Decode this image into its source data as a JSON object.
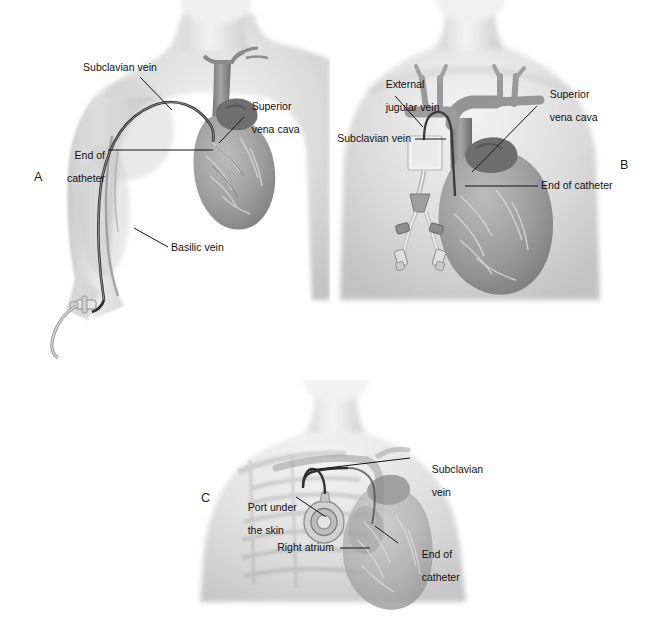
{
  "figure": {
    "width": 660,
    "height": 624,
    "background_color": "#ffffff",
    "ink_color": "#151515",
    "skin_tone": "#d9d9d9",
    "vessel_tone": "#8c8c8c",
    "heart_tone": "#a0a0a0"
  },
  "panels": [
    {
      "letter": "A",
      "name": "peripherally-inserted-central-catheter",
      "labels": [
        {
          "id": "subclavian-vein",
          "text": "Subclavian vein",
          "align": "left"
        },
        {
          "id": "superior-vena-cava",
          "text": "Superior\nvena cava",
          "align": "left"
        },
        {
          "id": "end-of-catheter",
          "text": "End of\ncatheter",
          "align": "right"
        },
        {
          "id": "basilic-vein",
          "text": "Basilic vein",
          "align": "left"
        }
      ]
    },
    {
      "letter": "B",
      "name": "tunneled-central-venous-catheter",
      "labels": [
        {
          "id": "external-jugular-vein",
          "text": "External\njugular vein",
          "align": "left"
        },
        {
          "id": "superior-vena-cava",
          "text": "Superior\nvena cava",
          "align": "left"
        },
        {
          "id": "subclavian-vein",
          "text": "Subclavian vein",
          "align": "left"
        },
        {
          "id": "end-of-catheter",
          "text": "End of catheter",
          "align": "left"
        }
      ]
    },
    {
      "letter": "C",
      "name": "implanted-port",
      "labels": [
        {
          "id": "subclavian-vein",
          "text": "Subclavian\nvein",
          "align": "left"
        },
        {
          "id": "port-under-the-skin",
          "text": "Port under\nthe skin",
          "align": "left"
        },
        {
          "id": "right-atrium",
          "text": "Right atrium",
          "align": "left"
        },
        {
          "id": "end-of-catheter",
          "text": "End of\ncatheter",
          "align": "left"
        }
      ]
    }
  ],
  "panel_a": {
    "letter": "A",
    "label_subclavian_vein": "Subclavian vein",
    "label_superior_vena_cava_line1": "Superior",
    "label_superior_vena_cava_line2": "vena cava",
    "label_end_of_catheter_line1": "End of",
    "label_end_of_catheter_line2": "catheter",
    "label_basilic_vein": "Basilic vein"
  },
  "panel_b": {
    "letter": "B",
    "label_external_jugular_vein_line1": "External",
    "label_external_jugular_vein_line2": "jugular vein",
    "label_superior_vena_cava_line1": "Superior",
    "label_superior_vena_cava_line2": "vena cava",
    "label_subclavian_vein": "Subclavian vein",
    "label_end_of_catheter": "End of catheter"
  },
  "panel_c": {
    "letter": "C",
    "label_subclavian_vein_line1": "Subclavian",
    "label_subclavian_vein_line2": "vein",
    "label_port_under_the_skin_line1": "Port under",
    "label_port_under_the_skin_line2": "the skin",
    "label_right_atrium": "Right atrium",
    "label_end_of_catheter_line1": "End of",
    "label_end_of_catheter_line2": "catheter"
  }
}
